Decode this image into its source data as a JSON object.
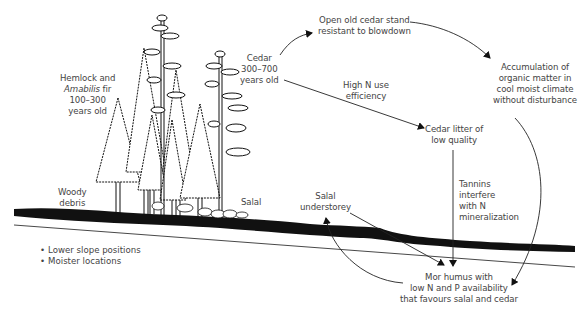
{
  "diagram": {
    "title": "",
    "labels": {
      "hemlock": [
        "Hemlock and",
        "Amabilis fir",
        "100–300",
        "years old"
      ],
      "hemlock_italic_word": "Amabilis",
      "cedar": [
        "Cedar",
        "300–700",
        "years old"
      ],
      "open_stand": [
        "Open old cedar stand",
        "resistant to blowdown"
      ],
      "accumulation": [
        "Accumulation of",
        "organic matter in",
        "cool moist climate",
        "without disturbance"
      ],
      "high_n": [
        "High N use",
        "efficiency"
      ],
      "cedar_litter": [
        "Cedar litter of",
        "low quality"
      ],
      "tannins": [
        "Tannins",
        "interfere",
        "with N",
        "mineralization"
      ],
      "salal_understorey": [
        "Salal",
        "understorey"
      ],
      "mor_humus": [
        "Mor humus with",
        "low N and P availability",
        "that favours salal and cedar"
      ],
      "woody_debris": [
        "Woody",
        "debris"
      ],
      "salal": "Salal"
    },
    "bullets": [
      "Lower slope positions",
      "Moister locations"
    ],
    "edges": [
      {
        "from": "Cedar 300–700 years old",
        "to": "Open old cedar stand resistant to blowdown"
      },
      {
        "from": "Open old cedar stand resistant to blowdown",
        "to": "Accumulation of organic matter in cool moist climate without disturbance"
      },
      {
        "from": "Cedar 300–700 years old",
        "to": "Cedar litter of low quality",
        "label": "High N use efficiency"
      },
      {
        "from": "Accumulation of organic matter in cool moist climate without disturbance",
        "to": "Mor humus with low N and P availability that favours salal and cedar"
      },
      {
        "from": "Cedar litter of low quality",
        "to": "Mor humus with low N and P availability that favours salal and cedar",
        "label": "Tannins interfere with N mineralization"
      },
      {
        "from": "Salal understorey",
        "to": "Mor humus with low N and P availability that favours salal and cedar"
      },
      {
        "from": "Mor humus with low N and P availability that favours salal and cedar",
        "to": "Salal understorey"
      }
    ],
    "colors": {
      "ink": "#111111",
      "text": "#444444",
      "background": "#ffffff"
    }
  }
}
